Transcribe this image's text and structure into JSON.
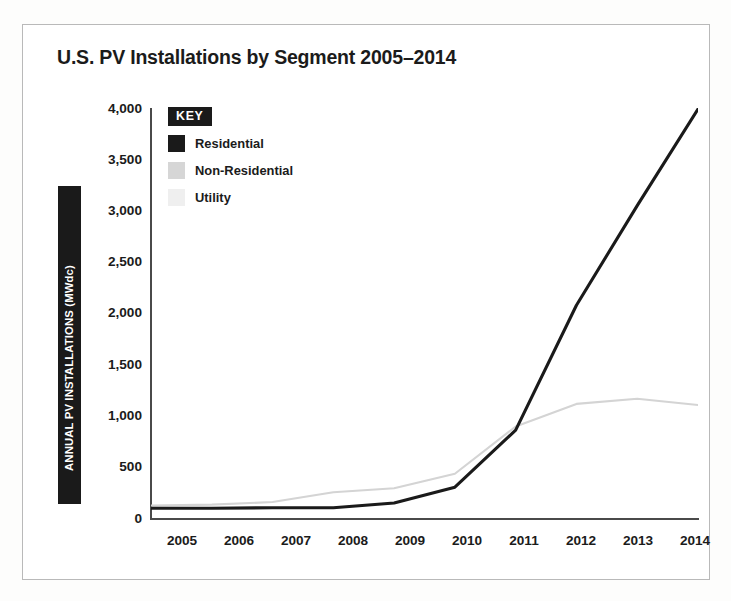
{
  "chart_data": {
    "type": "line",
    "title": "U.S. PV Installations by Segment 2005–2014",
    "xlabel": "",
    "ylabel": "ANNUAL PV INSTALLATIONS (MWdc)",
    "categories": [
      "2005",
      "2006",
      "2007",
      "2008",
      "2009",
      "2010",
      "2011",
      "2012",
      "2013",
      "2014"
    ],
    "x": [
      2005,
      2006,
      2007,
      2008,
      2009,
      2010,
      2011,
      2012,
      2013,
      2014
    ],
    "ylim": [
      0,
      4000
    ],
    "xlim": [
      2005,
      2014
    ],
    "yticks": [
      0,
      500,
      1000,
      1500,
      2000,
      2500,
      3000,
      3500,
      4000
    ],
    "ytick_labels": [
      "0",
      "500",
      "1,000",
      "1,500",
      "2,000",
      "2,500",
      "3,000",
      "3,500",
      "4,000"
    ],
    "grid": false,
    "legend_position": "upper-left-inside",
    "legend_title": "KEY",
    "series": [
      {
        "name": "Residential",
        "color": "#1a1a1a",
        "values": [
          105,
          105,
          110,
          110,
          155,
          310,
          865,
          2080,
          3050,
          3990
        ]
      },
      {
        "name": "Non-Residential",
        "color": "#d4d4d4",
        "values": [
          130,
          140,
          165,
          260,
          300,
          440,
          900,
          1120,
          1170,
          1110
        ]
      },
      {
        "name": "Utility",
        "color": "#efefef",
        "values": [
          0,
          0,
          0,
          0,
          0,
          0,
          0,
          0,
          0,
          0
        ]
      }
    ]
  },
  "legend": {
    "key_label": "KEY",
    "entries": [
      {
        "label": "Residential",
        "color": "#1a1a1a"
      },
      {
        "label": "Non-Residential",
        "color": "#d6d6d6"
      },
      {
        "label": "Utility",
        "color": "#efefef"
      }
    ]
  },
  "axes": {
    "y_axis_title": "ANNUAL PV INSTALLATIONS (MWdc)",
    "y_tick_labels": [
      "4,000",
      "3,500",
      "3,000",
      "2,500",
      "2,000",
      "1,500",
      "1,000",
      "500",
      "0"
    ],
    "x_tick_labels": [
      "2005",
      "2006",
      "2007",
      "2008",
      "2009",
      "2010",
      "2011",
      "2012",
      "2013",
      "2014"
    ]
  },
  "colors": {
    "residential": "#1a1a1a",
    "non_residential": "#d4d4d4",
    "utility": "#efefef",
    "axis": "#4a4a4a",
    "frame": "#b9b9b9",
    "text": "#1b1b1b"
  }
}
